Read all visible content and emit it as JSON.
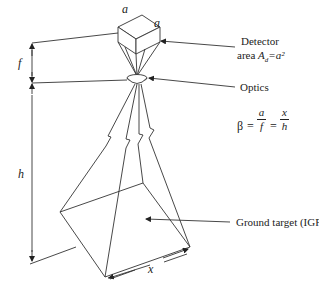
{
  "labels": {
    "detector_side_a_top": "a",
    "detector_side_a_right": "a",
    "detector": "Detector",
    "detector_area_prefix": "area ",
    "detector_area_symbol": "A",
    "detector_area_subscript": "d",
    "detector_area_suffix": "=a²",
    "optics": "Optics",
    "focal_length": "f",
    "height": "h",
    "ground_width": "x",
    "ground_target": "Ground target (IGFOV)"
  },
  "equation": {
    "beta": "β",
    "eq1": "=",
    "frac1_num": "a",
    "frac1_den": "f",
    "eq2": "=",
    "frac2_num": "x",
    "frac2_den": "h"
  },
  "colors": {
    "line": "#333333",
    "text": "#222222",
    "background": "#ffffff"
  }
}
